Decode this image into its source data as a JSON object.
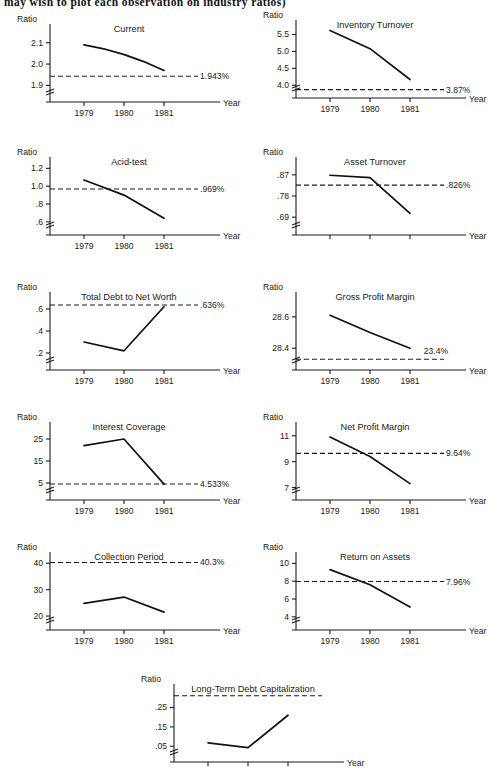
{
  "header": {
    "text": "may wish to plot each observation on industry ratios)"
  },
  "labels": {
    "ratio": "Ratio",
    "year": "Year"
  },
  "chart_data": [
    {
      "id": "current",
      "type": "line",
      "title": "Current",
      "xlabel": "Year",
      "ylabel": "Ratio",
      "categories": [
        "1979",
        "1980",
        "1981"
      ],
      "yticks": [
        "2.1",
        "2.0",
        "1.9"
      ],
      "ytickvals": [
        2.1,
        2.0,
        1.9
      ],
      "values": [
        2.09,
        2.05,
        1.97
      ],
      "ylim": [
        1.85,
        2.16
      ],
      "reference_line": 1.943,
      "reference_label": "1.943%",
      "axis_break": true,
      "grid": false,
      "curved": true
    },
    {
      "id": "inventory-turnover",
      "type": "line",
      "title": "Inventory Turnover",
      "xlabel": "Year",
      "ylabel": "Ratio",
      "categories": [
        "1979",
        "1980",
        "1981"
      ],
      "yticks": [
        "5.5",
        "5.0",
        "4.5",
        "4.0"
      ],
      "ytickvals": [
        5.5,
        5.0,
        4.5,
        4.0
      ],
      "values": [
        5.62,
        5.08,
        4.17
      ],
      "ylim": [
        3.8,
        5.75
      ],
      "reference_line": 3.87,
      "reference_label": "3.87%",
      "axis_break": true,
      "grid": false,
      "curved": false
    },
    {
      "id": "acid-test",
      "type": "line",
      "title": "Acid-test",
      "xlabel": "Year",
      "ylabel": "Ratio",
      "categories": [
        "1979",
        "1980",
        "1981"
      ],
      "yticks": [
        "1.2",
        "1.0",
        ".8",
        ".6"
      ],
      "ytickvals": [
        1.2,
        1.0,
        0.8,
        0.6
      ],
      "values": [
        1.07,
        0.9,
        0.64
      ],
      "ylim": [
        0.52,
        1.26
      ],
      "reference_line": 0.969,
      "reference_label": ".969%",
      "axis_break": true,
      "grid": false,
      "curved": false
    },
    {
      "id": "asset-turnover",
      "type": "line",
      "title": "Asset Turnover",
      "xlabel": "Year",
      "ylabel": "Ratio",
      "categories": [
        "",
        "",
        ""
      ],
      "yticks": [
        ".87",
        ".78",
        ".69"
      ],
      "ytickvals": [
        0.87,
        0.78,
        0.69
      ],
      "values": [
        0.868,
        0.858,
        0.706
      ],
      "ylim": [
        0.64,
        0.92
      ],
      "reference_line": 0.826,
      "reference_label": ".826%",
      "axis_break": true,
      "grid": false,
      "curved": false
    },
    {
      "id": "total-debt-to-net-worth",
      "type": "line",
      "title": "Total Debt to Net Worth",
      "xlabel": "Year",
      "ylabel": "Ratio",
      "categories": [
        "1979",
        "1980",
        "1981"
      ],
      "yticks": [
        ".6",
        ".4",
        ".2"
      ],
      "ytickvals": [
        0.6,
        0.4,
        0.2
      ],
      "values": [
        0.3,
        0.22,
        0.62
      ],
      "ylim": [
        0.1,
        0.7
      ],
      "reference_line": 0.636,
      "reference_label": ".636%",
      "axis_break": true,
      "grid": false,
      "curved": false
    },
    {
      "id": "gross-profit-margin",
      "type": "line",
      "title": "Gross Profit Margin",
      "xlabel": "Year",
      "ylabel": "Ratio",
      "categories": [
        "1979",
        "1980",
        "1981"
      ],
      "yticks": [
        "28.6",
        "28.4"
      ],
      "ytickvals": [
        28.6,
        28.4
      ],
      "values": [
        28.61,
        28.5,
        28.4
      ],
      "ylim": [
        28.3,
        28.72
      ],
      "reference_line": 28.33,
      "reference_label": "23.4%",
      "axis_break": true,
      "grid": false,
      "curved": false
    },
    {
      "id": "interest-coverage",
      "type": "line",
      "title": "Interest Coverage",
      "xlabel": "Year",
      "ylabel": "Ratio",
      "categories": [
        "1979",
        "1980",
        "1981"
      ],
      "yticks": [
        "25",
        "15",
        "5"
      ],
      "ytickvals": [
        25,
        15,
        5
      ],
      "values": [
        22,
        25,
        4.5
      ],
      "ylim": [
        0,
        30
      ],
      "reference_line": 4.533,
      "reference_label": "4.533%",
      "axis_break": true,
      "grid": false,
      "curved": false
    },
    {
      "id": "net-profit-margin",
      "type": "line",
      "title": "Net Profit Margin",
      "xlabel": "Year",
      "ylabel": "Ratio",
      "categories": [
        "1979",
        "1980",
        "1981"
      ],
      "yticks": [
        "11",
        "9",
        "7"
      ],
      "ytickvals": [
        11,
        9,
        7
      ],
      "values": [
        10.9,
        9.4,
        7.3
      ],
      "ylim": [
        6.5,
        11.6
      ],
      "reference_line": 9.64,
      "reference_label": "9.64%",
      "axis_break": true,
      "grid": false,
      "curved": false
    },
    {
      "id": "collection-period",
      "type": "line",
      "title": "Collection Period",
      "xlabel": "Year",
      "ylabel": "Ratio",
      "categories": [
        "1979",
        "1980",
        "1981"
      ],
      "yticks": [
        "40",
        "30",
        "20"
      ],
      "ytickvals": [
        40,
        30,
        20
      ],
      "values": [
        24.8,
        27.2,
        21.5
      ],
      "ylim": [
        17,
        42
      ],
      "reference_line": 40.3,
      "reference_label": "40.3%",
      "axis_break": true,
      "grid": false,
      "curved": false
    },
    {
      "id": "return-on-assets",
      "type": "line",
      "title": "Return on Assets",
      "xlabel": "Year",
      "ylabel": "Ratio",
      "categories": [
        "1979",
        "1980",
        "1981"
      ],
      "yticks": [
        "10",
        "8",
        "6",
        "4"
      ],
      "ytickvals": [
        10,
        8,
        6,
        4
      ],
      "values": [
        9.3,
        7.6,
        5.1
      ],
      "ylim": [
        3.2,
        10.6
      ],
      "reference_line": 7.96,
      "reference_label": "7.96%",
      "axis_break": true,
      "grid": false,
      "curved": false
    },
    {
      "id": "long-term-debt-capitalization",
      "type": "line",
      "title": "Long-Term Debt Capitalization",
      "xlabel": "Year",
      "ylabel": "Ratio",
      "categories": [
        "",
        "",
        ""
      ],
      "yticks": [
        ".25",
        ".15",
        ".05"
      ],
      "ytickvals": [
        0.25,
        0.15,
        0.05
      ],
      "values": [
        0.068,
        0.043,
        0.21
      ],
      "ylim": [
        0.0,
        0.34
      ],
      "reference_line": 0.31,
      "reference_label": "",
      "axis_break": true,
      "grid": false,
      "curved": false
    }
  ]
}
